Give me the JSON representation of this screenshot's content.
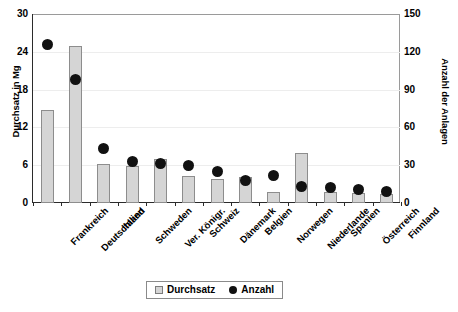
{
  "chart_data": {
    "type": "bar",
    "title": "",
    "xlabel": "",
    "ylabel": "Durchsatz in Mg",
    "y2label": "Anzahl der Anlagen",
    "ylim": [
      0,
      30
    ],
    "y2lim": [
      0,
      150
    ],
    "yticks": [
      0,
      6,
      12,
      18,
      24,
      30
    ],
    "y2ticks": [
      0,
      30,
      60,
      90,
      120,
      150
    ],
    "grid": true,
    "legend_position": "bottom-center",
    "categories": [
      "Frankreich",
      "Deutschland",
      "Italien",
      "Schweden",
      "Ver. Königr.",
      "Schweiz",
      "Dänemark",
      "Belgien",
      "Norwegen",
      "Niederlande",
      "Spanien",
      "Österreich",
      "Finnland"
    ],
    "series": [
      {
        "name": "Durchsatz",
        "axis": "left",
        "unit": "Mg",
        "marker": "bar",
        "values": [
          14.8,
          24.9,
          6.2,
          5.9,
          7.0,
          4.3,
          3.8,
          4.2,
          1.8,
          8.0,
          1.7,
          1.6,
          1.4
        ]
      },
      {
        "name": "Anzahl",
        "axis": "right",
        "unit": "Anlagen",
        "marker": "dot",
        "values": [
          126,
          98,
          43,
          33,
          31,
          30,
          25,
          18,
          22,
          13,
          12,
          11,
          9
        ]
      }
    ],
    "legend": [
      "Durchsatz",
      "Anzahl"
    ],
    "colors": {
      "bar_fill": "#d5d5d5",
      "bar_stroke": "#8d8d8d",
      "dot": "#111111",
      "axis": "#2b2b2b",
      "grid": "#ededed"
    }
  }
}
